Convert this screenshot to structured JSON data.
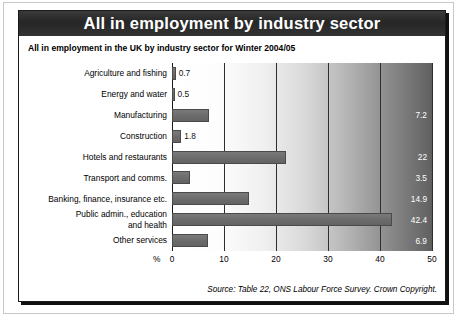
{
  "card": {
    "title": "All in employment by industry sector",
    "subtitle": "All in employment in the UK by industry sector for Winter 2004/05",
    "source": "Source: Table 22, ONS Labour Force Survey. Crown Copyright.",
    "title_bar_color": "#2b2b2b",
    "bar_color": "#6e6e6e",
    "border_color": "#1a1a1a"
  },
  "chart_data": {
    "type": "bar",
    "orientation": "horizontal",
    "title": "All in employment by industry sector",
    "subtitle": "All in employment in the UK by industry sector for Winter 2004/05",
    "xlabel": "%",
    "ylabel": "",
    "categories": [
      "Agriculture and fishing",
      "Energy and water",
      "Manufacturing",
      "Construction",
      "Hotels and restaurants",
      "Transport and comms.",
      "Banking, finance, insurance etc.",
      "Public admin., education and health",
      "Other services"
    ],
    "values": [
      0.7,
      0.5,
      7.2,
      1.8,
      22,
      3.5,
      14.9,
      42.4,
      6.9
    ],
    "value_labels": [
      "0.7",
      "0.5",
      "7.2",
      "1.8",
      "22",
      "3.5",
      "14.9",
      "42.4",
      "6.9"
    ],
    "label_placement": [
      "outside",
      "outside",
      "inside",
      "outside",
      "inside",
      "inside",
      "inside",
      "inside",
      "inside"
    ],
    "xlim": [
      0,
      50
    ],
    "xticks": [
      0,
      10,
      20,
      30,
      40,
      50
    ],
    "xtick_labels": [
      "0",
      "10",
      "20",
      "30",
      "40",
      "50"
    ],
    "grid": true,
    "legend": false,
    "plot_background": "white-to-dark-gray horizontal gradient"
  }
}
